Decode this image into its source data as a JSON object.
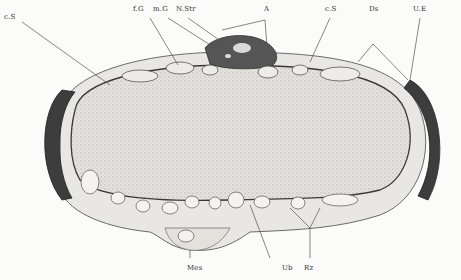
{
  "figure": {
    "type": "histological cross-section illustration",
    "labels": {
      "cs_left": "c.S",
      "fg": "f.G",
      "mg": "m.G",
      "nstr": "N.Str",
      "a": "A",
      "cs_right": "c.S",
      "ds": "Ds",
      "ue": "U.E",
      "mes": "Mes",
      "ub": "Ub",
      "rz": "Rz"
    },
    "colors": {
      "background": "#fbfbfa",
      "tissue_fill": "#dcdad6",
      "outline": "#2a2a2a",
      "dark_tissue": "#4a4a4a",
      "leader_line": "#555555"
    }
  }
}
